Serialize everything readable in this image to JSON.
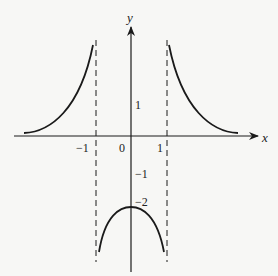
{
  "axes": {
    "x_label": "x",
    "y_label": "y",
    "origin_label": "0"
  },
  "ticks": {
    "x_neg1": "−1",
    "x_pos1": "1",
    "y_pos1": "1",
    "y_neg1": "−1",
    "y_neg2": "−2"
  },
  "asymptotes": [
    {
      "type": "vertical",
      "x": -1,
      "style": "dashed"
    },
    {
      "type": "vertical",
      "x": 1,
      "style": "dashed"
    },
    {
      "type": "horizontal",
      "y": 0,
      "style": "x-axis"
    }
  ],
  "curves": [
    {
      "name": "left-branch",
      "domain": "x < -1",
      "behavior": "increases from 0 toward +infinity as x approaches -1"
    },
    {
      "name": "middle-branch",
      "domain": "-1 < x < 1",
      "behavior": "concave down, maximum at (0, -2), approaches -infinity at x = ±1"
    },
    {
      "name": "right-branch",
      "domain": "x > 1",
      "behavior": "decreases from +infinity toward 0"
    }
  ],
  "colors": {
    "stroke": "#1a1a1a",
    "background": "#f7f7f5"
  }
}
